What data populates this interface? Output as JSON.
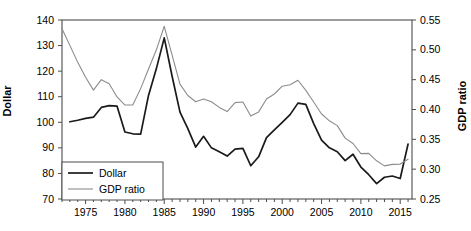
{
  "chart_data": {
    "type": "line",
    "title": "",
    "xlabel": "",
    "ylabel": "Dollar",
    "y2label": "GDP ratio",
    "grid": false,
    "legend_position": "bottom-left",
    "xlim": [
      1972,
      2016.5
    ],
    "ylim": [
      70,
      140
    ],
    "y2lim": [
      0.25,
      0.55
    ],
    "xticks": [
      1975,
      1980,
      1985,
      1990,
      1995,
      2000,
      2005,
      2010,
      2015
    ],
    "xtick_labels": [
      "1975",
      "1980",
      "1985",
      "1990",
      "1995",
      "2000",
      "2005",
      "2010",
      "2015"
    ],
    "yticks": [
      70,
      80,
      90,
      100,
      110,
      120,
      130,
      140
    ],
    "ytick_labels": [
      "70",
      "80",
      "90",
      "100",
      "110",
      "120",
      "130",
      "140"
    ],
    "y2ticks": [
      0.25,
      0.3,
      0.35,
      0.4,
      0.45,
      0.5,
      0.55
    ],
    "y2tick_labels": [
      "0.25",
      "0.30",
      "0.35",
      "0.40",
      "0.45",
      "0.50",
      "0.55"
    ],
    "minor_xticks": true,
    "series": [
      {
        "name": "Dollar",
        "color": "#1a1a1a",
        "width": 1.7,
        "axis": "left",
        "x": [
          1973,
          1974,
          1975,
          1976,
          1977,
          1978,
          1979,
          1980,
          1981,
          1982,
          1983,
          1984,
          1985,
          1986,
          1987,
          1988,
          1989,
          1990,
          1991,
          1992,
          1993,
          1994,
          1995,
          1996,
          1997,
          1998,
          1999,
          2000,
          2001,
          2002,
          2003,
          2004,
          2005,
          2006,
          2007,
          2008,
          2009,
          2010,
          2011,
          2012,
          2013,
          2014,
          2015,
          2016
        ],
        "values": [
          100.2,
          100.8,
          101.5,
          102.0,
          105.8,
          106.5,
          106.3,
          96.2,
          95.5,
          95.4,
          110.5,
          121.0,
          133.0,
          118.0,
          104.0,
          97.5,
          90.3,
          94.5,
          90.0,
          88.5,
          86.8,
          89.5,
          89.8,
          83.0,
          86.5,
          94.0,
          97.0,
          100.0,
          103.0,
          107.5,
          107.0,
          99.5,
          93.0,
          90.0,
          88.5,
          85.0,
          87.5,
          82.5,
          79.5,
          76.0,
          78.5,
          79.0,
          78.0,
          91.5
        ]
      },
      {
        "name": "GDP ratio",
        "color": "#8c8c8c",
        "width": 1.1,
        "axis": "right",
        "x": [
          1972,
          1973,
          1974,
          1975,
          1976,
          1977,
          1978,
          1979,
          1980,
          1981,
          1982,
          1983,
          1984,
          1985,
          1986,
          1987,
          1988,
          1989,
          1990,
          1991,
          1992,
          1993,
          1994,
          1995,
          1996,
          1997,
          1998,
          1999,
          2000,
          2001,
          2002,
          2003,
          2004,
          2005,
          2006,
          2007,
          2008,
          2009,
          2010,
          2011,
          2012,
          2013,
          2014,
          2015,
          2016
        ],
        "values": [
          0.5355,
          0.5075,
          0.479,
          0.454,
          0.4325,
          0.45,
          0.443,
          0.421,
          0.4075,
          0.4075,
          0.435,
          0.468,
          0.5,
          0.5395,
          0.491,
          0.4425,
          0.4235,
          0.413,
          0.4175,
          0.413,
          0.4035,
          0.3965,
          0.4115,
          0.4125,
          0.389,
          0.396,
          0.4175,
          0.426,
          0.439,
          0.4415,
          0.449,
          0.432,
          0.4125,
          0.3925,
          0.381,
          0.373,
          0.352,
          0.343,
          0.326,
          0.3265,
          0.314,
          0.3055,
          0.308,
          0.3085,
          0.3165
        ]
      }
    ]
  },
  "legend": {
    "items": [
      {
        "label": "Dollar"
      },
      {
        "label": "GDP ratio"
      }
    ]
  },
  "axes": {
    "left_title": "Dollar",
    "right_title": "GDP ratio"
  }
}
